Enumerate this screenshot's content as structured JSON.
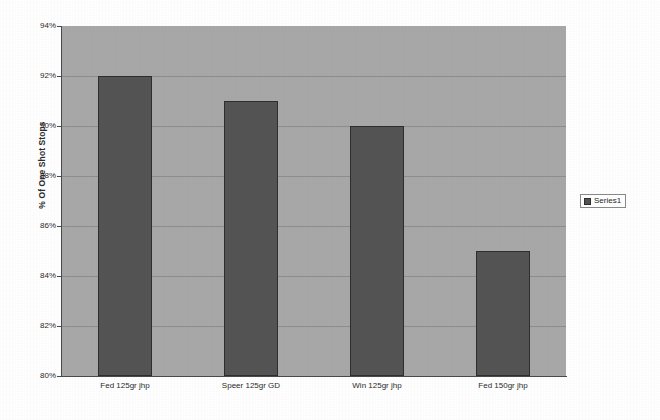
{
  "chart_data": {
    "type": "bar",
    "title": "",
    "xlabel": "",
    "ylabel": "% Of One Shot Stops",
    "categories": [
      "Fed 125gr jhp",
      "Speer 125gr GD",
      "Win 125gr jhp",
      "Fed 150gr jhp"
    ],
    "values": [
      92,
      91,
      90,
      85
    ],
    "series": [
      {
        "name": "Series1",
        "values": [
          92,
          91,
          90,
          85
        ]
      }
    ],
    "ylim": [
      80,
      94
    ],
    "ytick_step": 2,
    "ytick_labels": [
      "94%",
      "92%",
      "90%",
      "88%",
      "86%",
      "84%",
      "82%",
      "80%"
    ],
    "ytick_values": [
      94,
      92,
      90,
      88,
      86,
      84,
      82,
      80
    ],
    "grid": true,
    "grid_axis": "y",
    "legend": {
      "visible": true,
      "position": "right",
      "entries": [
        {
          "label": "Series1",
          "color": "#545454"
        }
      ]
    },
    "colors": {
      "bar_fill": "#545454",
      "bar_border": "#2e2e2e",
      "plot_background": "#a8a8a8",
      "gridline": "#8e8e8e",
      "axis_line": "#4a4a4a",
      "page_background": "#ffffff",
      "text": "#2b2b2b"
    }
  }
}
